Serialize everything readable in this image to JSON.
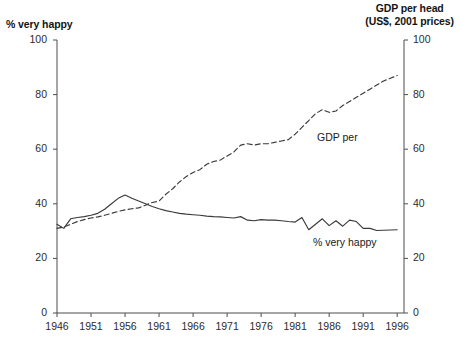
{
  "chart_data": {
    "type": "line",
    "title": "",
    "xlabel": "",
    "left_axis": {
      "label": "% very happy",
      "ticks": [
        "0",
        "20",
        "40",
        "60",
        "80",
        "100"
      ],
      "ylim": [
        0,
        100
      ]
    },
    "right_axis": {
      "label_line1": "GDP per head",
      "label_line2": "(US$, 2001 prices)",
      "ticks": [
        "0",
        "20",
        "40",
        "60",
        "80",
        "100"
      ],
      "ylim": [
        0,
        100
      ]
    },
    "xticks": [
      "1946",
      "1951",
      "1956",
      "1961",
      "1966",
      "1971",
      "1976",
      "1981",
      "1986",
      "1991",
      "1996"
    ],
    "xlim": [
      1946,
      1997
    ],
    "grid": false,
    "legend_position": "inline-annotation",
    "annotations": [
      {
        "text": "GDP per",
        "series": "gdp-per-head"
      },
      {
        "text": "% very happy",
        "series": "percent-very-happy"
      }
    ],
    "series": [
      {
        "name": "% very happy",
        "style": "solid",
        "color": "#3a3a3a",
        "axis": "left",
        "x": [
          1946,
          1947,
          1948,
          1949,
          1950,
          1951,
          1952,
          1953,
          1954,
          1955,
          1956,
          1957,
          1958,
          1959,
          1960,
          1961,
          1962,
          1963,
          1964,
          1965,
          1966,
          1967,
          1968,
          1969,
          1970,
          1971,
          1972,
          1973,
          1974,
          1975,
          1976,
          1977,
          1978,
          1979,
          1980,
          1981,
          1982,
          1983,
          1984,
          1985,
          1986,
          1987,
          1988,
          1989,
          1990,
          1991,
          1992,
          1993,
          1994,
          1995,
          1996
        ],
        "values": [
          32.5,
          31.0,
          34.5,
          35.0,
          35.3,
          35.8,
          36.5,
          38.0,
          40.0,
          42.0,
          43.2,
          42.0,
          41.0,
          40.0,
          39.0,
          38.2,
          37.5,
          37.0,
          36.5,
          36.2,
          36.0,
          35.8,
          35.5,
          35.3,
          35.2,
          35.0,
          34.8,
          35.3,
          34.0,
          33.8,
          34.2,
          34.0,
          34.0,
          33.8,
          33.5,
          33.3,
          35.0,
          30.5,
          32.5,
          34.5,
          32.0,
          33.8,
          31.8,
          34.0,
          33.5,
          31.0,
          31.0,
          30.2,
          30.3,
          30.4,
          30.5
        ]
      },
      {
        "name": "GDP per head",
        "style": "dashed",
        "color": "#3a3a3a",
        "axis": "right",
        "x": [
          1946,
          1947,
          1948,
          1949,
          1950,
          1951,
          1952,
          1953,
          1954,
          1955,
          1956,
          1957,
          1958,
          1959,
          1960,
          1961,
          1962,
          1963,
          1964,
          1965,
          1966,
          1967,
          1968,
          1969,
          1970,
          1971,
          1972,
          1973,
          1974,
          1975,
          1976,
          1977,
          1978,
          1979,
          1980,
          1981,
          1982,
          1983,
          1984,
          1985,
          1986,
          1987,
          1988,
          1989,
          1990,
          1991,
          1992,
          1993,
          1994,
          1995,
          1996
        ],
        "values": [
          31.0,
          31.5,
          32.5,
          33.5,
          34.2,
          34.8,
          35.2,
          35.8,
          36.5,
          37.2,
          37.8,
          38.2,
          38.5,
          39.5,
          40.5,
          41.0,
          43.5,
          45.5,
          48.0,
          50.0,
          51.5,
          52.5,
          54.5,
          55.5,
          56.0,
          57.5,
          59.0,
          61.5,
          62.0,
          61.5,
          62.0,
          62.0,
          62.5,
          63.0,
          63.5,
          65.5,
          68.0,
          70.5,
          73.0,
          74.5,
          73.5,
          74.0,
          76.0,
          77.5,
          79.0,
          80.5,
          82.0,
          83.5,
          85.0,
          86.0,
          87.0
        ]
      }
    ]
  },
  "caption": {
    "text": ""
  }
}
